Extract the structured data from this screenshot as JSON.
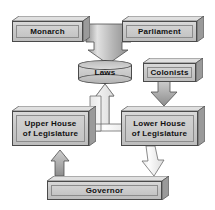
{
  "diagram": {
    "type": "flowchart",
    "background_color": "#ffffff",
    "node_fill_color": "#c9c9c9",
    "node_border_color": "#4a4a4a",
    "arrow_gray_color": "#b0b0b0",
    "arrow_white_color": "#f2f2f2",
    "text_color": "#111111",
    "nodes": [
      {
        "id": "monarch",
        "label": "Monarch",
        "shape": "box-3d",
        "x": 12,
        "y": 16,
        "w": 78,
        "h": 26
      },
      {
        "id": "parliament",
        "label": "Parliament",
        "shape": "box-3d",
        "x": 122,
        "y": 16,
        "w": 82,
        "h": 26
      },
      {
        "id": "laws",
        "label": "Laws",
        "shape": "cylinder",
        "x": 78,
        "y": 60,
        "w": 54,
        "h": 24
      },
      {
        "id": "colonists",
        "label": "Colonists",
        "shape": "box-3d",
        "x": 143,
        "y": 58,
        "w": 60,
        "h": 24
      },
      {
        "id": "upper-house",
        "label": "Upper House\nof Legislature",
        "shape": "box-3d",
        "x": 12,
        "y": 106,
        "w": 84,
        "h": 40
      },
      {
        "id": "lower-house",
        "label": "Lower House\nof Legislature",
        "shape": "box-3d",
        "x": 121,
        "y": 106,
        "w": 84,
        "h": 40
      },
      {
        "id": "governor",
        "label": "Governor",
        "shape": "box-3d",
        "x": 47,
        "y": 176,
        "w": 122,
        "h": 24
      }
    ],
    "connections": [
      {
        "id": "monarch-to-laws",
        "from": "monarch",
        "to": "laws",
        "style": "gray-filled",
        "direction": "down"
      },
      {
        "id": "parliament-to-laws",
        "from": "parliament",
        "to": "laws",
        "style": "gray-filled",
        "direction": "down"
      },
      {
        "id": "upper-house-to-laws",
        "from": "upper-house",
        "to": "laws",
        "style": "white-outlined",
        "direction": "up"
      },
      {
        "id": "lower-house-to-laws",
        "from": "lower-house",
        "to": "laws",
        "style": "white-outlined",
        "direction": "up"
      },
      {
        "id": "colonists-to-lower",
        "from": "colonists",
        "to": "lower-house",
        "style": "gray-filled",
        "direction": "down"
      },
      {
        "id": "lower-to-governor",
        "from": "lower-house",
        "to": "governor",
        "style": "white-outlined",
        "direction": "down"
      },
      {
        "id": "governor-to-upper",
        "from": "governor",
        "to": "upper-house",
        "style": "gray-filled",
        "direction": "up"
      }
    ]
  }
}
